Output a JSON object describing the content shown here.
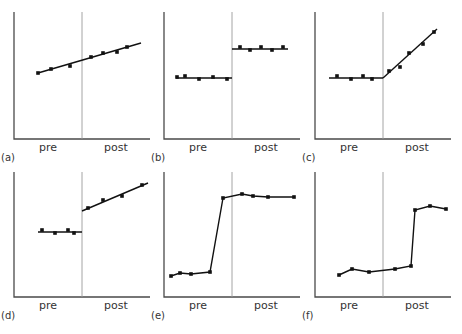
{
  "chart_data": [
    {
      "panel": "(a)",
      "type": "scatter",
      "description": "Continuous linear trend, no change at intervention",
      "xlabels": [
        "pre",
        "post"
      ],
      "box": {
        "x0": 14,
        "y0": 12,
        "x1": 150,
        "y1": 139,
        "divider": 82
      },
      "points": [
        [
          38,
          73
        ],
        [
          51,
          69
        ],
        [
          70,
          66
        ],
        [
          91,
          57
        ],
        [
          103,
          53
        ],
        [
          117,
          52
        ],
        [
          127,
          47
        ]
      ],
      "fit_lines": [
        [
          [
            38,
            73
          ],
          [
            141,
            43
          ]
        ]
      ],
      "connect_points": false
    },
    {
      "panel": "(b)",
      "type": "scatter",
      "description": "Level change (step up), no slope",
      "xlabels": [
        "pre",
        "post"
      ],
      "box": {
        "x0": 164,
        "y0": 12,
        "x1": 300,
        "y1": 139,
        "divider": 232
      },
      "points": [
        [
          177,
          77
        ],
        [
          185,
          76
        ],
        [
          199,
          79
        ],
        [
          213,
          77
        ],
        [
          227,
          79
        ],
        [
          240,
          47
        ],
        [
          250,
          50
        ],
        [
          261,
          47
        ],
        [
          272,
          50
        ],
        [
          283,
          47
        ]
      ],
      "fit_lines": [
        [
          [
            176,
            78
          ],
          [
            232,
            78
          ]
        ],
        [
          [
            232,
            49
          ],
          [
            288,
            49
          ]
        ]
      ],
      "connect_points": false
    },
    {
      "panel": "(c)",
      "type": "scatter",
      "description": "Flat pre, slope change post",
      "xlabels": [
        "pre",
        "post"
      ],
      "box": {
        "x0": 315,
        "y0": 12,
        "x1": 451,
        "y1": 139,
        "divider": 383
      },
      "points": [
        [
          337,
          76
        ],
        [
          351,
          79
        ],
        [
          363,
          76
        ],
        [
          372,
          79
        ],
        [
          389,
          71
        ],
        [
          400,
          67
        ],
        [
          409,
          53
        ],
        [
          423,
          44
        ],
        [
          434,
          32
        ]
      ],
      "fit_lines": [
        [
          [
            329,
            78
          ],
          [
            383,
            78
          ]
        ],
        [
          [
            383,
            78
          ],
          [
            437,
            29
          ]
        ]
      ],
      "connect_points": false
    },
    {
      "panel": "(d)",
      "type": "scatter",
      "description": "Level and slope change",
      "xlabels": [
        "pre",
        "post"
      ],
      "box": {
        "x0": 14,
        "y0": 172,
        "x1": 150,
        "y1": 297,
        "divider": 82
      },
      "points": [
        [
          42,
          230
        ],
        [
          55,
          233
        ],
        [
          68,
          230
        ],
        [
          74,
          233
        ],
        [
          88,
          208
        ],
        [
          103,
          200
        ],
        [
          122,
          196
        ],
        [
          142,
          185
        ]
      ],
      "fit_lines": [
        [
          [
            38,
            232
          ],
          [
            82,
            232
          ]
        ],
        [
          [
            82,
            211
          ],
          [
            148,
            183
          ]
        ]
      ],
      "connect_points": false
    },
    {
      "panel": "(e)",
      "type": "line",
      "description": "Change occurs before intervention",
      "xlabels": [
        "pre",
        "post"
      ],
      "box": {
        "x0": 164,
        "y0": 172,
        "x1": 300,
        "y1": 297,
        "divider": 232
      },
      "points": [
        [
          171,
          276
        ],
        [
          180,
          273
        ],
        [
          191,
          274
        ],
        [
          210,
          272
        ],
        [
          223,
          198
        ],
        [
          242,
          194
        ],
        [
          253,
          196
        ],
        [
          268,
          197
        ],
        [
          294,
          197
        ]
      ],
      "fit_lines": [],
      "connect_points": true
    },
    {
      "panel": "(f)",
      "type": "line",
      "description": "Delayed change after intervention",
      "xlabels": [
        "pre",
        "post"
      ],
      "box": {
        "x0": 315,
        "y0": 172,
        "x1": 451,
        "y1": 297,
        "divider": 383
      },
      "points": [
        [
          339,
          275
        ],
        [
          352,
          269
        ],
        [
          369,
          272
        ],
        [
          395,
          269
        ],
        [
          411,
          266
        ],
        [
          415,
          210
        ],
        [
          430,
          206
        ],
        [
          446,
          209
        ]
      ],
      "fit_lines": [],
      "connect_points": true
    }
  ]
}
